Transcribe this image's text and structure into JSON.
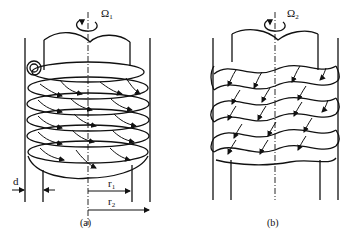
{
  "figure": {
    "panels": [
      {
        "id": "a",
        "caption": "(a)",
        "rotation_label": "Ω",
        "rotation_subscript": "1",
        "dimension_labels": {
          "gap": "d",
          "inner_radius": "r",
          "inner_radius_sub": "1",
          "outer_radius": "r",
          "outer_radius_sub": "2"
        },
        "pattern": "toroidal vortex cells with curved arrows (Taylor vortices)",
        "cell_rows": 6
      },
      {
        "id": "b",
        "caption": "(b)",
        "rotation_label": "Ω",
        "rotation_subscript": "2",
        "pattern": "wavy vortex cells with arrows (wavy Taylor vortices)",
        "cell_rows": 6
      }
    ],
    "colors": {
      "ink": "#111111",
      "background": "#ffffff"
    }
  }
}
